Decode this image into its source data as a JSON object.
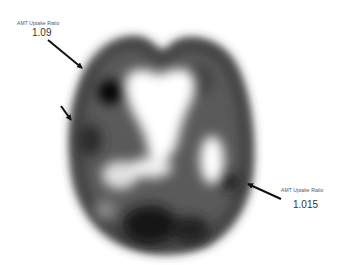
{
  "figure": {
    "annotations": [
      {
        "label": "AMT Uptake Ratio",
        "value": "1.09",
        "side": "upper-left"
      },
      {
        "label": "AMT Uptake Ratio",
        "value": "1.015",
        "side": "lower-right"
      }
    ],
    "arrows": [
      {
        "name": "arrow-upper-left",
        "from": [
          48,
          40
        ],
        "to": [
          82,
          68
        ]
      },
      {
        "name": "arrow-mid-left",
        "from": [
          61,
          106
        ],
        "to": [
          71,
          120
        ]
      },
      {
        "name": "arrow-right",
        "from": [
          281,
          199
        ],
        "to": [
          248,
          184
        ]
      }
    ],
    "colors": {
      "background": "#ffffff",
      "arrow": "#111111",
      "tissue_dark": "#111111",
      "tissue_light": "#ffffff"
    }
  }
}
